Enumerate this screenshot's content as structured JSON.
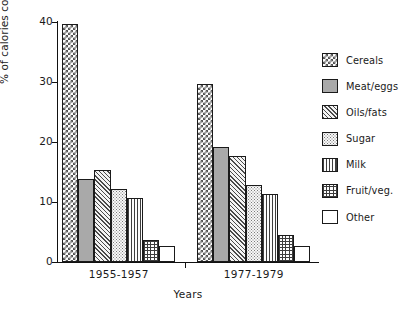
{
  "chart_data": {
    "type": "bar",
    "title": "",
    "xlabel": "Years",
    "ylabel": "% of calories consumed",
    "ylim": [
      0,
      40
    ],
    "yticks": [
      0,
      10,
      20,
      30,
      40
    ],
    "grid": false,
    "legend_position": "right",
    "categories": [
      "1955-1957",
      "1977-1979"
    ],
    "series": [
      {
        "name": "Cereals",
        "pattern": "checkerboard",
        "values": [
          39.7,
          29.6
        ]
      },
      {
        "name": "Meat/eggs",
        "pattern": "solid-gray",
        "values": [
          13.8,
          19.2
        ]
      },
      {
        "name": "Oils/fats",
        "pattern": "diagonal-hatch",
        "values": [
          15.3,
          17.6
        ]
      },
      {
        "name": "Sugar",
        "pattern": "fine-dots",
        "values": [
          12.2,
          12.9
        ]
      },
      {
        "name": "Milk",
        "pattern": "vertical-lines",
        "values": [
          10.7,
          11.3
        ]
      },
      {
        "name": "Fruit/veg.",
        "pattern": "cross-hatch",
        "values": [
          3.6,
          4.5
        ]
      },
      {
        "name": "Other",
        "pattern": "blank-white",
        "values": [
          2.6,
          2.6
        ]
      }
    ]
  },
  "axis": {
    "y_title": "% of calories consumed",
    "x_title": "Years",
    "y_tick_labels": [
      "40",
      "30",
      "20",
      "10",
      "0"
    ],
    "group_labels": [
      "1955-1957",
      "1977-1979"
    ]
  },
  "legend": {
    "items": [
      {
        "label": "Cereals"
      },
      {
        "label": "Meat/eggs"
      },
      {
        "label": "Oils/fats"
      },
      {
        "label": "Sugar"
      },
      {
        "label": "Milk"
      },
      {
        "label": "Fruit/veg."
      },
      {
        "label": "Other"
      }
    ]
  }
}
